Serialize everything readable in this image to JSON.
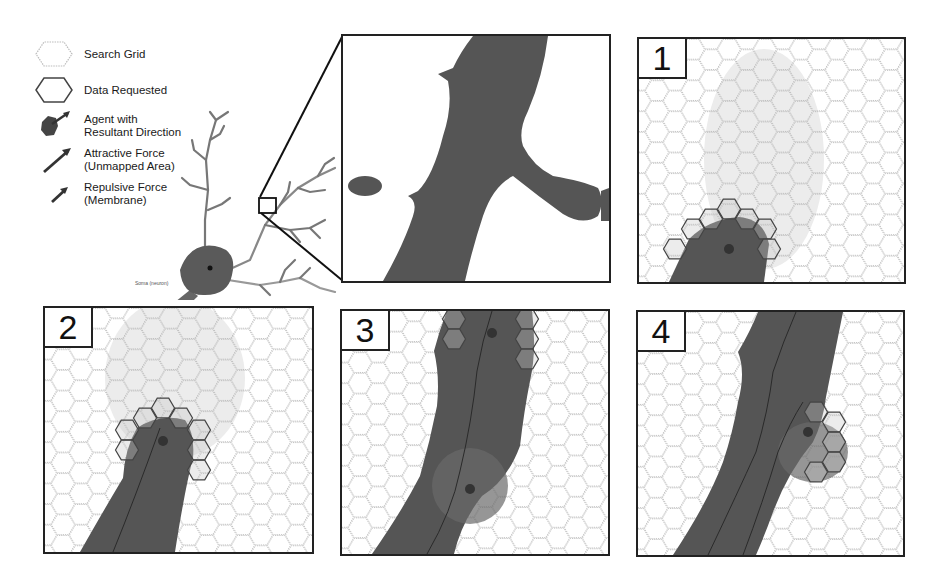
{
  "legend": {
    "items": [
      {
        "key": "search-grid",
        "label": "Search Grid",
        "label2": ""
      },
      {
        "key": "data-requested",
        "label": "Data Requested",
        "label2": ""
      },
      {
        "key": "agent",
        "label": "Agent with",
        "label2": "Resultant Direction"
      },
      {
        "key": "attractive-force",
        "label": "Attractive Force",
        "label2": "(Unmapped Area)"
      },
      {
        "key": "repulsive-force",
        "label": "Repulsive Force",
        "label2": "(Membrane)"
      }
    ]
  },
  "neuron": {
    "label_soma": "Soma (neuron)",
    "label_agent": "Agent Drop Location(s)"
  },
  "panels": [
    {
      "id": "1",
      "label": "1"
    },
    {
      "id": "2",
      "label": "2"
    },
    {
      "id": "3",
      "label": "3"
    },
    {
      "id": "4",
      "label": "4"
    }
  ],
  "colors": {
    "membrane": "#555555",
    "grid_line": "#b5b5b5",
    "requested_line": "#444444",
    "unmapped_tint": "#ececec",
    "border": "#222222"
  },
  "grid": {
    "hex_radius": 12
  }
}
